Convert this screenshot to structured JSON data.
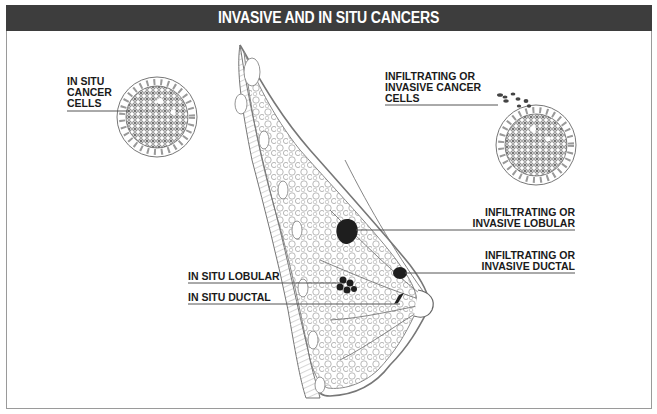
{
  "title": "INVASIVE AND IN SITU CANCERS",
  "labels": {
    "in_situ_cells": [
      "IN SITU",
      "CANCER",
      "CELLS"
    ],
    "invasive_cells": [
      "INFILTRATING OR",
      "INVASIVE CANCER",
      "CELLS"
    ],
    "invasive_lobular": [
      "INFILTRATING OR",
      "INVASIVE LOBULAR"
    ],
    "invasive_ductal": [
      "INFILTRATING OR",
      "INVASIVE DUCTAL"
    ],
    "in_situ_lobular": "IN SITU LOBULAR",
    "in_situ_ductal": "IN SITU DUCTAL"
  },
  "colors": {
    "header_bg": "#3d3d3d",
    "header_text": "#ffffff",
    "line": "#555555",
    "tissue": "#8a8a8a",
    "tumor": "#1e1e1e"
  }
}
